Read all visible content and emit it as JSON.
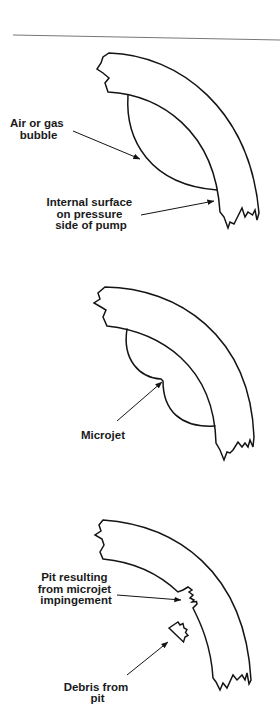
{
  "colors": {
    "stroke": "#141414",
    "rule": "#777777",
    "background": "#ffffff",
    "text": "#1a1a1a"
  },
  "panels": [
    {
      "stage": "bubble-in-pump-casing",
      "labels": [
        {
          "lines": [
            "Air or gas",
            "bubble"
          ]
        },
        {
          "lines": [
            "Internal surface",
            "on pressure",
            "side of pump"
          ]
        }
      ]
    },
    {
      "stage": "bubble-collapse",
      "labels": [
        {
          "lines": [
            "Microjet"
          ]
        }
      ]
    },
    {
      "stage": "pit-formation",
      "labels": [
        {
          "lines": [
            "Pit resulting",
            "from microjet",
            "impingement"
          ]
        },
        {
          "lines": [
            "Debris from",
            "pit"
          ]
        }
      ]
    }
  ]
}
